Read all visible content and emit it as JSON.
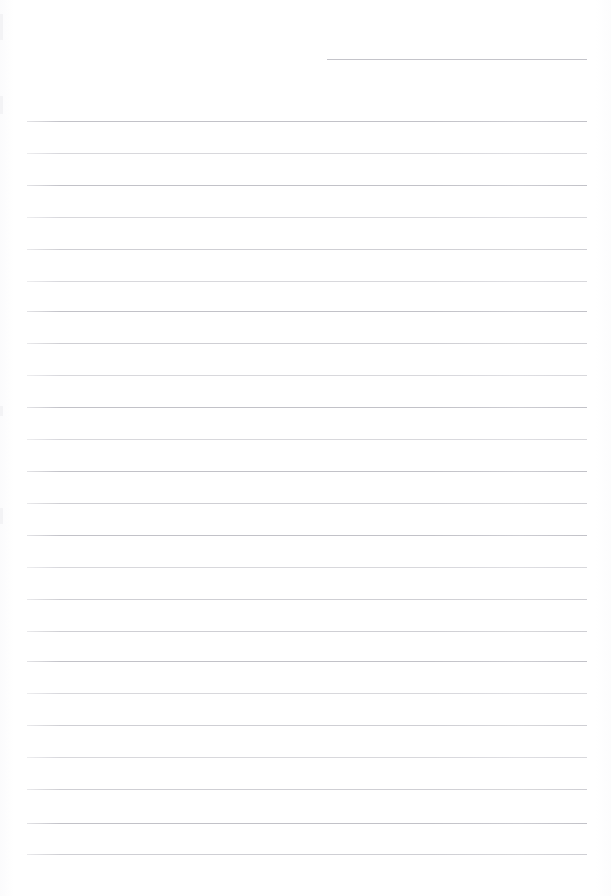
{
  "document": {
    "kind": "scanned-lined-paper",
    "title": "",
    "body_text": "",
    "page_width": 611,
    "page_height": 896,
    "background_color": "#fefefe",
    "is_blank": true
  },
  "colors": {
    "page_background": "#fefefe",
    "rule_line": "#c9c9ce",
    "rule_line_faint": "#d6d6db",
    "rule_line_strong": "#bfbfc6",
    "header_rule": "#c4c4ca",
    "edge_artifact": "#f2f2f4"
  },
  "ruling": {
    "left_margin_x": 27,
    "right_margin_x": 587,
    "line_spacing": 32,
    "first_line_y": 121,
    "line_count": 24,
    "line_thickness": 1
  },
  "header_rule": {
    "x": 327,
    "y": 59,
    "width": 260,
    "thickness": 1
  },
  "rules": [
    {
      "y": 121,
      "weight": "strong"
    },
    {
      "y": 153,
      "weight": "faint"
    },
    {
      "y": 185,
      "weight": "strong"
    },
    {
      "y": 217,
      "weight": "faint"
    },
    {
      "y": 249,
      "weight": "mid"
    },
    {
      "y": 281,
      "weight": "faint"
    },
    {
      "y": 311,
      "weight": "strong"
    },
    {
      "y": 343,
      "weight": "mid"
    },
    {
      "y": 375,
      "weight": "faint"
    },
    {
      "y": 407,
      "weight": "strong"
    },
    {
      "y": 439,
      "weight": "faint"
    },
    {
      "y": 471,
      "weight": "strong"
    },
    {
      "y": 503,
      "weight": "mid"
    },
    {
      "y": 535,
      "weight": "strong"
    },
    {
      "y": 567,
      "weight": "faint"
    },
    {
      "y": 599,
      "weight": "mid"
    },
    {
      "y": 631,
      "weight": "mid"
    },
    {
      "y": 661,
      "weight": "strong"
    },
    {
      "y": 693,
      "weight": "faint"
    },
    {
      "y": 725,
      "weight": "mid"
    },
    {
      "y": 757,
      "weight": "faint"
    },
    {
      "y": 789,
      "weight": "mid"
    },
    {
      "y": 823,
      "weight": "strong"
    },
    {
      "y": 854,
      "weight": "mid"
    }
  ],
  "edge_artifacts": [
    {
      "y": 14,
      "height": 26
    },
    {
      "y": 96,
      "height": 18
    },
    {
      "y": 406,
      "height": 10
    },
    {
      "y": 508,
      "height": 16
    }
  ],
  "accessibility": {
    "page_label": "Blank ruled notebook page",
    "content_note": "No handwriting or printed text present"
  }
}
